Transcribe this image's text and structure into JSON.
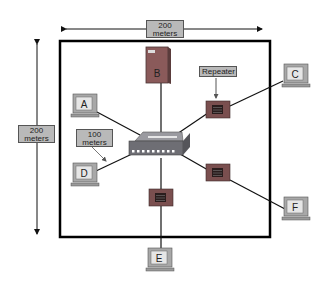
{
  "diagram": {
    "dimension_labels": {
      "horizontal": {
        "line1": "200",
        "line2": "meters"
      },
      "vertical": {
        "line1": "200",
        "line2": "meters"
      },
      "segment": {
        "line1": "100",
        "line2": "meters"
      }
    },
    "repeater_label": "Repeater",
    "nodes": [
      {
        "id": "A",
        "type": "workstation",
        "label": "A"
      },
      {
        "id": "B",
        "type": "server",
        "label": "B"
      },
      {
        "id": "C",
        "type": "workstation",
        "label": "C"
      },
      {
        "id": "D",
        "type": "workstation",
        "label": "D"
      },
      {
        "id": "E",
        "type": "workstation",
        "label": "E"
      },
      {
        "id": "F",
        "type": "workstation",
        "label": "F"
      },
      {
        "id": "hub",
        "type": "hub",
        "label": ""
      },
      {
        "id": "R1",
        "type": "repeater",
        "label": ""
      },
      {
        "id": "R2",
        "type": "repeater",
        "label": ""
      },
      {
        "id": "R3",
        "type": "repeater",
        "label": ""
      }
    ],
    "links": [
      [
        "hub",
        "A"
      ],
      [
        "hub",
        "B"
      ],
      [
        "hub",
        "D"
      ],
      [
        "hub",
        "R1"
      ],
      [
        "R1",
        "C"
      ],
      [
        "hub",
        "R2"
      ],
      [
        "R2",
        "F"
      ],
      [
        "hub",
        "R3"
      ],
      [
        "R3",
        "E"
      ]
    ],
    "colors": {
      "device_body": "#8a5a5a",
      "device_dark": "#4a3636",
      "hub_body": "#7a7a80",
      "monitor": "#a8a8a8",
      "screen": "#e6e6e6",
      "label_bg": "#b9b9b9",
      "boundary": "#000000"
    }
  }
}
